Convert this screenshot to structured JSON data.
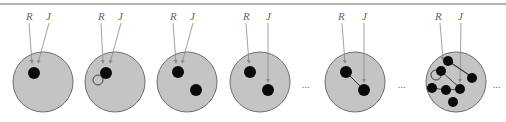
{
  "figure": {
    "colors": {
      "circle_fill": "#c4c4c4",
      "circle_stroke": "#6e6e6e",
      "node": "#0a0a0a",
      "arrow": "#8a8a8a",
      "rule": "#9a9a9a"
    },
    "labels": {
      "r": "R",
      "j": "J"
    },
    "ellipsis": "...",
    "panels": [
      {
        "id": 1,
        "description": "single node, R and J point to it"
      },
      {
        "id": 2,
        "description": "single node with self-loop"
      },
      {
        "id": 3,
        "description": "two nodes, R and J point to first"
      },
      {
        "id": 4,
        "description": "two nodes, R to first, J to second"
      },
      {
        "id": 5,
        "description": "two nodes connected by edge"
      },
      {
        "id": 6,
        "description": "many nodes with multiple edges and loop"
      }
    ]
  }
}
